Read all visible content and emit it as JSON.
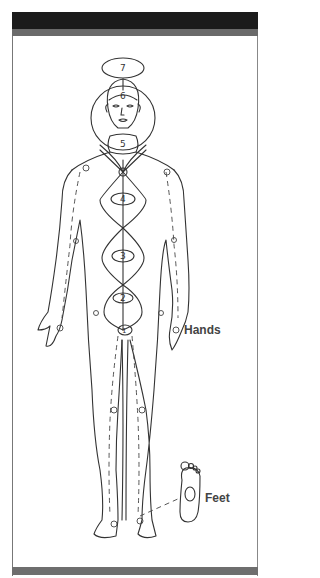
{
  "diagram": {
    "chakras": [
      {
        "number": "1",
        "location": "root"
      },
      {
        "number": "2",
        "location": "sacral"
      },
      {
        "number": "3",
        "location": "solar plexus"
      },
      {
        "number": "4",
        "location": "heart"
      },
      {
        "number": "5",
        "location": "throat"
      },
      {
        "number": "6",
        "location": "brow"
      },
      {
        "number": "7",
        "location": "crown"
      }
    ],
    "labels": {
      "hands": "Hands",
      "feet": "Feet"
    },
    "colors": {
      "frame_top": "#1b1b1b",
      "frame_band": "#6a6a6a",
      "line": "#333333",
      "background": "#ffffff"
    }
  }
}
